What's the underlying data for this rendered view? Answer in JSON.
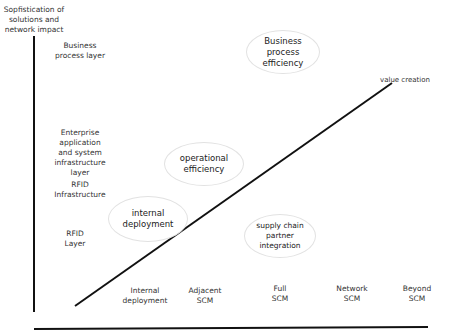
{
  "y_axis": {
    "label": "Sopfistication of\nsolutions and\nnetwork impact"
  },
  "y_categories": [
    {
      "label": "Business\nprocess layer"
    },
    {
      "label": "Enterprise\napplication\nand system\ninfrastructure\nlayer"
    },
    {
      "label": "RFID\nInfrastructure"
    },
    {
      "label": "RFID\nLayer"
    }
  ],
  "x_categories": [
    {
      "label": "Internal\ndeployment"
    },
    {
      "label": "Adjacent\nSCM"
    },
    {
      "label": "Full\nSCM"
    },
    {
      "label": "Network\nSCM"
    },
    {
      "label": "Beyond\nSCM"
    }
  ],
  "trend_line": {
    "label": "value creation"
  },
  "bubbles": [
    {
      "label": "Business\nprocess\nefficiency"
    },
    {
      "label": "operational\nefficiency"
    },
    {
      "label": "internal\ndeployment"
    },
    {
      "label": "supply chain\npartner\nintegration"
    }
  ]
}
